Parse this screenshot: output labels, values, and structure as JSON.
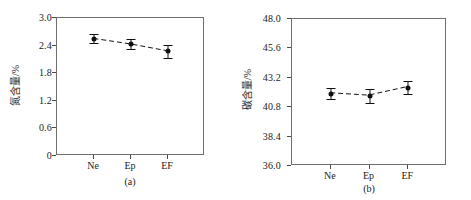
{
  "figure": {
    "background_color": "#ffffff",
    "ink_color": "#101010",
    "frame_color": "#6e6e6e"
  },
  "chart_data": [
    {
      "type": "scatter",
      "panel": "a",
      "title": "",
      "caption": "(a)",
      "xlabel": "",
      "ylabel": "氮含量/%",
      "categories": [
        "Ne",
        "Ep",
        "EF"
      ],
      "values": [
        2.55,
        2.43,
        2.28
      ],
      "errors": [
        0.1,
        0.11,
        0.14
      ],
      "yticks": [
        "0",
        "0.6",
        "1.2",
        "1.8",
        "2.4",
        "3.0"
      ],
      "ytick_values": [
        0,
        0.6,
        1.2,
        1.8,
        2.4,
        3.0
      ],
      "ylim": [
        0,
        3.0
      ],
      "grid": false,
      "legend": "none",
      "line_style": "dashed",
      "marker": "filled-square"
    },
    {
      "type": "scatter",
      "panel": "b",
      "title": "",
      "caption": "(b)",
      "xlabel": "",
      "ylabel": "碳含量/%",
      "categories": [
        "Ne",
        "Ep",
        "EF"
      ],
      "values": [
        41.9,
        41.7,
        42.4
      ],
      "errors": [
        0.45,
        0.55,
        0.55
      ],
      "yticks": [
        "36.0",
        "38.4",
        "40.8",
        "43.2",
        "45.6",
        "48.0"
      ],
      "ytick_values": [
        36.0,
        38.4,
        40.8,
        43.2,
        45.6,
        48.0
      ],
      "ylim": [
        36.0,
        48.0
      ],
      "grid": false,
      "legend": "none",
      "line_style": "dashed",
      "marker": "filled-square"
    }
  ]
}
